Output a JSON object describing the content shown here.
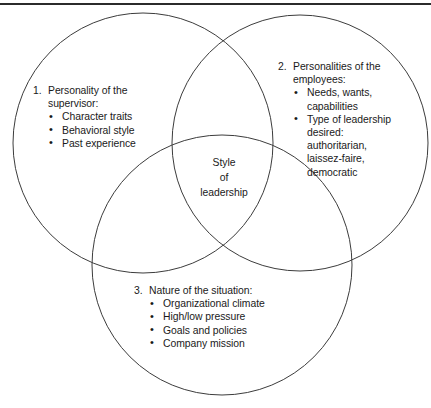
{
  "diagram": {
    "type": "venn",
    "circle_count": 3,
    "stroke_color": "#3c3c3c",
    "fill_color": "#ffffff",
    "background_color": "#ffffff",
    "top_rule_color": "#2b2b2b",
    "center_label": {
      "lines": [
        "Style",
        "of",
        "leadership"
      ]
    },
    "groups": [
      {
        "number": "1.",
        "heading_lines": [
          "Personality of the",
          "supervisor:"
        ],
        "heading": "Personality of the supervisor:",
        "bullet_char": "•",
        "bullets": [
          "Character traits",
          "Behavioral style",
          "Past experience"
        ]
      },
      {
        "number": "2.",
        "heading_lines": [
          "Personalities of the",
          "employees:"
        ],
        "heading": "Personalities of the employees:",
        "bullet_char": "•",
        "bullets": [
          "Needs, wants, capabilities",
          "Type of leadership desired: authoritarian, laissez-faire, democratic"
        ],
        "bullets_wrapped": [
          [
            "Needs, wants,",
            "capabilities"
          ],
          [
            "Type of leadership",
            "desired:",
            "authoritarian,",
            "laissez-faire,",
            "democratic"
          ]
        ]
      },
      {
        "number": "3.",
        "heading_lines": [
          "Nature of the situation:"
        ],
        "heading": "Nature of the situation:",
        "bullet_char": "•",
        "bullets": [
          "Organizational climate",
          "High/low pressure",
          "Goals and policies",
          "Company mission"
        ]
      }
    ]
  }
}
